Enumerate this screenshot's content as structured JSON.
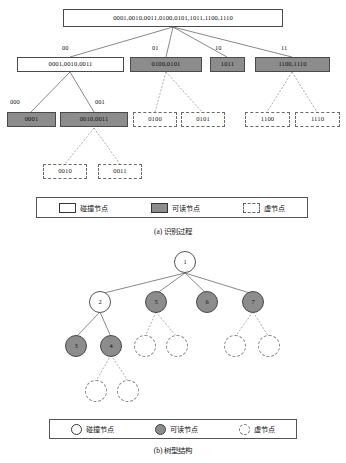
{
  "figure": {
    "panel_a": {
      "caption": "(a) 识别过程",
      "root": {
        "label": "0001,0010,0011,0100,0101,1011,1100,1110",
        "type": "collision"
      },
      "level2": [
        {
          "edge": "00",
          "label": "0001,0010,0011",
          "type": "collision"
        },
        {
          "edge": "01",
          "label": "0100,0101",
          "type": "readable"
        },
        {
          "edge": "10",
          "label": "1011",
          "type": "readable"
        },
        {
          "edge": "11",
          "label": "1100,1110",
          "type": "readable"
        }
      ],
      "level3": [
        {
          "edge": "000",
          "label": "0001",
          "type": "readable"
        },
        {
          "edge": "001",
          "label": "0010,0011",
          "type": "readable"
        },
        {
          "edge": "",
          "label": "0100",
          "type": "virtual"
        },
        {
          "edge": "",
          "label": "0101",
          "type": "virtual"
        },
        {
          "edge": "",
          "label": "1100",
          "type": "virtual"
        },
        {
          "edge": "",
          "label": "1110",
          "type": "virtual"
        }
      ],
      "level4": [
        {
          "label": "0010",
          "type": "virtual"
        },
        {
          "label": "0011",
          "type": "virtual"
        }
      ],
      "legend": [
        {
          "swatch": "white",
          "text": "碰撞节点"
        },
        {
          "swatch": "gray",
          "text": "可读节点"
        },
        {
          "swatch": "dash",
          "text": "虚节点"
        }
      ]
    },
    "panel_b": {
      "caption": "(b) 树型结构",
      "nodes": [
        {
          "id": "n1",
          "label": "1",
          "type": "collision"
        },
        {
          "id": "n2",
          "label": "2",
          "type": "collision"
        },
        {
          "id": "n5",
          "label": "5",
          "type": "readable"
        },
        {
          "id": "n6",
          "label": "6",
          "type": "readable"
        },
        {
          "id": "n7",
          "label": "7",
          "type": "readable"
        },
        {
          "id": "n3",
          "label": "3",
          "type": "readable"
        },
        {
          "id": "n4",
          "label": "4",
          "type": "readable"
        },
        {
          "id": "v1",
          "label": "",
          "type": "virtual"
        },
        {
          "id": "v2",
          "label": "",
          "type": "virtual"
        },
        {
          "id": "v3",
          "label": "",
          "type": "virtual"
        },
        {
          "id": "v4",
          "label": "",
          "type": "virtual"
        },
        {
          "id": "v5",
          "label": "",
          "type": "virtual"
        },
        {
          "id": "v6",
          "label": "",
          "type": "virtual"
        }
      ],
      "legend": [
        {
          "swatch": "white",
          "text": "碰撞节点"
        },
        {
          "swatch": "gray",
          "text": "可读节点"
        },
        {
          "swatch": "dash",
          "text": "虚节点"
        }
      ]
    }
  },
  "colors": {
    "readable_fill": "#8c8c8c",
    "collision_fill": "#ffffff",
    "virtual_stroke": "#8a8a8a",
    "line": "#555555"
  }
}
